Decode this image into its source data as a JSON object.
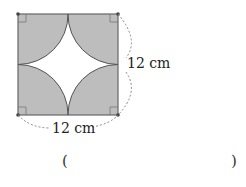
{
  "figure": {
    "side_label": "12 cm",
    "bottom_label": "12 cm",
    "fill_color": "#bdbdbd",
    "stroke_color": "#555555",
    "shape": "square with four quarter-circles centered at corners, white four-pointed star in center"
  },
  "answer": {
    "open_paren": "(",
    "close_paren": ")",
    "value": ""
  }
}
